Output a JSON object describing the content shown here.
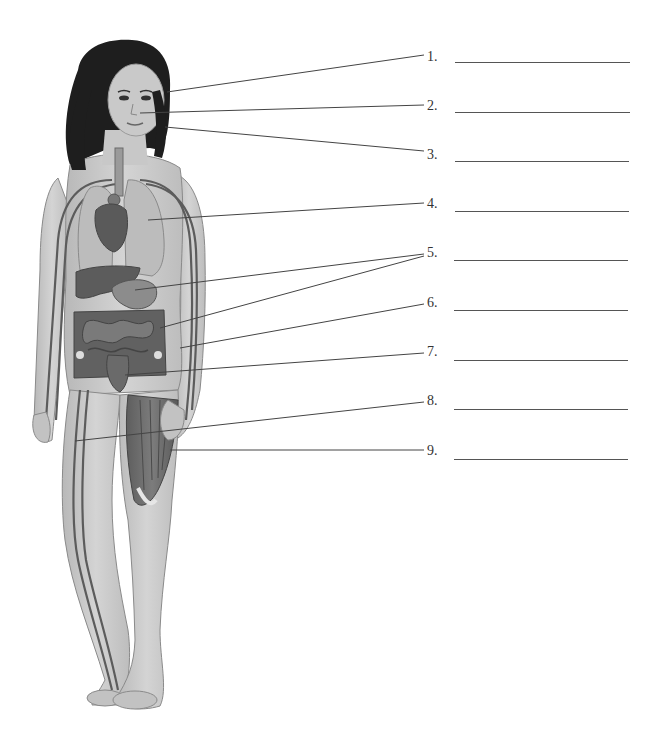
{
  "diagram": {
    "type": "anatomy-labeling",
    "labels": [
      {
        "number": "1.",
        "answer": "",
        "y": 57,
        "blank_y": 64,
        "leaders": [
          [
            167,
            92,
            424,
            55
          ]
        ]
      },
      {
        "number": "2.",
        "answer": "",
        "y": 106,
        "blank_y": 113,
        "leaders": [
          [
            140,
            113,
            424,
            105
          ]
        ]
      },
      {
        "number": "3.",
        "answer": "",
        "y": 155,
        "blank_y": 162,
        "leaders": [
          [
            165,
            127,
            424,
            151
          ]
        ]
      },
      {
        "number": "4.",
        "answer": "",
        "y": 204,
        "blank_y": 212,
        "leaders": [
          [
            148,
            220,
            424,
            203
          ]
        ]
      },
      {
        "number": "5.",
        "answer": "",
        "y": 253,
        "blank_y": 261,
        "leaders": [
          [
            135,
            290,
            424,
            254
          ],
          [
            160,
            328,
            424,
            256
          ]
        ]
      },
      {
        "number": "6.",
        "answer": "",
        "y": 302,
        "blank_y": 311,
        "leaders": [
          [
            180,
            348,
            424,
            304
          ]
        ]
      },
      {
        "number": "7.",
        "answer": "",
        "y": 352,
        "blank_y": 361,
        "leaders": [
          [
            125,
            375,
            424,
            353
          ]
        ]
      },
      {
        "number": "8.",
        "answer": "",
        "y": 401,
        "blank_y": 410,
        "leaders": [
          [
            75,
            441,
            424,
            402
          ]
        ]
      },
      {
        "number": "9.",
        "answer": "",
        "y": 451,
        "blank_y": 460,
        "leaders": [
          [
            170,
            450,
            424,
            450
          ]
        ]
      }
    ],
    "colors": {
      "skin": "#c9c9c9",
      "skin_dark": "#a9a9a9",
      "hair": "#1e1e1e",
      "organ": "#6b6b6b",
      "organ_dark": "#4f4f4f",
      "lung": "#b8b8b8",
      "vessel": "#5c5c5c",
      "muscle": "#6e6e6e",
      "leader": "#444444",
      "blank_line": "#555555"
    }
  }
}
